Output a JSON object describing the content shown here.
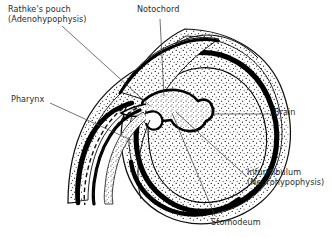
{
  "figure": {
    "background_color": "#ffffff",
    "ink_color": "#000000",
    "text_color": "#2b2b2b",
    "width": 333,
    "height": 238
  },
  "labels": {
    "rathkes_pouch": {
      "line1": "Rathke's pouch",
      "line2": "(Adenohypophysis)"
    },
    "notochord": {
      "line1": "Notochord"
    },
    "pharynx": {
      "line1": "Pharynx"
    },
    "brain": {
      "line1": "Brain"
    },
    "infundibulum": {
      "line1": "Infundibulum",
      "line2": "(Neurohypophysis)"
    },
    "stomodeum": {
      "line1": "Stomodeum"
    }
  },
  "structures": [
    {
      "name": "ectoderm-outer-layer",
      "fill": "stipple",
      "description": "Outer stippled body wall layer of embryo head"
    },
    {
      "name": "neural-tube-brain",
      "fill": "solid-black-outline-with-stipple",
      "description": "Developing brain, thick black ependymal outline with stippled neural tissue"
    },
    {
      "name": "notochord-rod",
      "fill": "stipple",
      "description": "Rod-like notochord beneath the brain floor"
    },
    {
      "name": "infundibulum-downgrowth",
      "fill": "stipple",
      "description": "Downgrowth from floor of diencephalon forming neurohypophysis"
    },
    {
      "name": "rathkes-pouch-diverticulum",
      "fill": "stipple",
      "description": "Ectodermal diverticulum from roof of stomodeum forming adenohypophysis"
    },
    {
      "name": "pharynx-cavity",
      "fill": "dashed-outline",
      "description": "Pharyngeal cavity indicated by dashed line"
    },
    {
      "name": "stomodeum-cavity",
      "fill": "open",
      "description": "Primitive oral cavity"
    }
  ],
  "leaders": [
    {
      "name": "leader-rathkes-pouch",
      "from": [
        62,
        26
      ],
      "to": [
        150,
        106
      ]
    },
    {
      "name": "leader-notochord",
      "from": [
        160,
        19
      ],
      "to": [
        164,
        96
      ]
    },
    {
      "name": "leader-pharynx",
      "from": [
        50,
        103
      ],
      "to": [
        131,
        140
      ]
    },
    {
      "name": "leader-brain",
      "from": [
        272,
        114
      ],
      "to": [
        214,
        114
      ]
    },
    {
      "name": "leader-infundibulum",
      "from": [
        246,
        176
      ],
      "to": [
        176,
        112
      ]
    },
    {
      "name": "leader-stomodeum",
      "from": [
        215,
        216
      ],
      "to": [
        172,
        113
      ]
    }
  ]
}
